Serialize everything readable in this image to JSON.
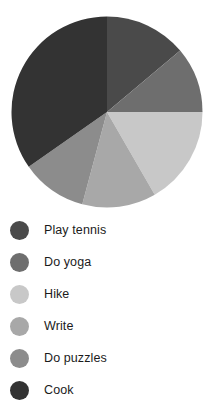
{
  "chart_data": {
    "type": "pie",
    "title": "",
    "categories": [
      "Play tennis",
      "Do yoga",
      "Hike",
      "Write",
      "Do puzzles",
      "Cook"
    ],
    "values": [
      13.9,
      11.1,
      16.7,
      12.5,
      11.1,
      34.7
    ],
    "units": "percent",
    "start_angle_deg": 0,
    "direction": "clockwise",
    "wedges": [
      {
        "label": "Play tennis",
        "value": 13.9,
        "start_deg": 0,
        "end_deg": 50,
        "color": "#4a4a4a"
      },
      {
        "label": "Do yoga",
        "value": 11.1,
        "start_deg": 50,
        "end_deg": 90,
        "color": "#6e6e6e"
      },
      {
        "label": "Hike",
        "value": 16.7,
        "start_deg": 90,
        "end_deg": 150,
        "color": "#c8c8c8"
      },
      {
        "label": "Write",
        "value": 12.5,
        "start_deg": 150,
        "end_deg": 195,
        "color": "#a8a8a8"
      },
      {
        "label": "Do puzzles",
        "value": 11.1,
        "start_deg": 195,
        "end_deg": 235,
        "color": "#8c8c8c"
      },
      {
        "label": "Cook",
        "value": 34.7,
        "start_deg": 235,
        "end_deg": 360,
        "color": "#333333"
      }
    ],
    "legend_position": "bottom",
    "grid": false,
    "xlabel": "",
    "ylabel": ""
  },
  "legend": {
    "items": [
      {
        "label": "Play tennis",
        "color": "#4a4a4a"
      },
      {
        "label": "Do yoga",
        "color": "#6e6e6e"
      },
      {
        "label": "Hike",
        "color": "#c8c8c8"
      },
      {
        "label": "Write",
        "color": "#a8a8a8"
      },
      {
        "label": "Do puzzles",
        "color": "#8c8c8c"
      },
      {
        "label": "Cook",
        "color": "#333333"
      }
    ]
  }
}
